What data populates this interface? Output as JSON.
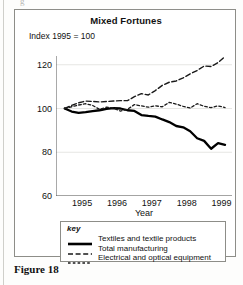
{
  "figure": {
    "caption": "Figure 18",
    "top_glyph": "g"
  },
  "chart_data": {
    "type": "line",
    "title": "Mixed Fortunes",
    "subtitle": "Index 1995 = 100",
    "xlabel": "Year",
    "ylabel": "",
    "ylim": [
      60,
      124
    ],
    "yticks": [
      60,
      80,
      100,
      120
    ],
    "xlim": [
      1994.75,
      1999.8
    ],
    "xticks": [
      1995,
      1996,
      1997,
      1998,
      1999
    ],
    "xtick_labels": [
      "1995",
      "1996",
      "1997",
      "1998",
      "1999"
    ],
    "grid": true,
    "legend_position": "below-axes",
    "legend_title": "key",
    "series": [
      {
        "name": "Textiles and textile products",
        "style": "solid",
        "color": "#000000",
        "width": 2.3,
        "x": [
          1995.0,
          1995.2,
          1995.4,
          1995.6,
          1995.8,
          1996.0,
          1996.2,
          1996.4,
          1996.6,
          1996.8,
          1997.0,
          1997.2,
          1997.4,
          1997.6,
          1997.8,
          1998.0,
          1998.2,
          1998.4,
          1998.6,
          1998.8,
          1999.0,
          1999.2,
          1999.4,
          1999.6
        ],
        "values": [
          100.0,
          98.6,
          98.0,
          98.3,
          98.8,
          99.2,
          99.8,
          100.2,
          100.0,
          99.2,
          98.9,
          97.0,
          96.6,
          96.3,
          95.0,
          93.8,
          92.0,
          91.4,
          89.6,
          86.4,
          85.2,
          81.6,
          84.2,
          83.4
        ]
      },
      {
        "name": "Total manufacturing",
        "style": "dashed-long",
        "color": "#1a1a1a",
        "width": 1.4,
        "x": [
          1995.0,
          1995.2,
          1995.4,
          1995.6,
          1995.8,
          1996.0,
          1996.2,
          1996.4,
          1996.6,
          1996.8,
          1997.0,
          1997.2,
          1997.4,
          1997.6,
          1997.8,
          1998.0,
          1998.2,
          1998.4,
          1998.6,
          1998.8,
          1999.0,
          1999.2,
          1999.4,
          1999.6
        ],
        "values": [
          100.0,
          101.4,
          102.6,
          103.4,
          103.2,
          103.0,
          103.2,
          103.4,
          103.6,
          103.6,
          105.4,
          106.8,
          106.2,
          108.2,
          110.6,
          112.0,
          112.6,
          114.0,
          115.8,
          117.4,
          119.4,
          119.2,
          121.0,
          123.8
        ]
      },
      {
        "name": "Electrical and optical equipment",
        "style": "dashed-short",
        "color": "#1a1a1a",
        "width": 1.3,
        "x": [
          1995.0,
          1995.2,
          1995.4,
          1995.6,
          1995.8,
          1996.0,
          1996.2,
          1996.4,
          1996.6,
          1996.8,
          1997.0,
          1997.2,
          1997.4,
          1997.6,
          1997.8,
          1998.0,
          1998.2,
          1998.4,
          1998.6,
          1998.8,
          1999.0,
          1999.2,
          1999.4,
          1999.6
        ],
        "values": [
          100.0,
          100.8,
          101.6,
          102.2,
          101.4,
          99.6,
          100.6,
          100.2,
          98.8,
          99.6,
          101.8,
          101.2,
          100.6,
          101.2,
          100.8,
          102.8,
          102.0,
          101.0,
          100.2,
          102.2,
          101.0,
          100.4,
          101.2,
          100.4
        ]
      }
    ]
  }
}
